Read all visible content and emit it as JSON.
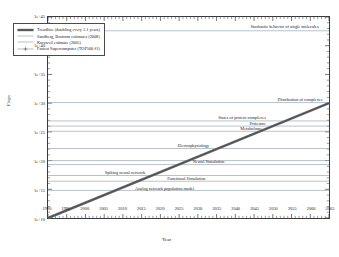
{
  "chart_data": {
    "type": "line",
    "title": "",
    "xlabel": "Year",
    "ylabel": "Flops",
    "xlim": [
      1990,
      2065
    ],
    "ylim": [
      10,
      45
    ],
    "y_scale": "log10",
    "grid": false,
    "xticks": [
      "1990",
      "1995",
      "2000",
      "2005",
      "2010",
      "2015",
      "2020",
      "2025",
      "2030",
      "2035",
      "2040",
      "2045",
      "2050",
      "2055",
      "2060",
      "2065"
    ],
    "xtick_values": [
      1990,
      1995,
      2000,
      2005,
      2010,
      2015,
      2020,
      2025,
      2030,
      2035,
      2040,
      2045,
      2050,
      2055,
      2060,
      2065
    ],
    "yticks": [
      "1e+10",
      "1e+15",
      "1e+20",
      "1e+25",
      "1e+30",
      "1e+35",
      "1e+40",
      "1e+45"
    ],
    "ytick_values": [
      10,
      15,
      20,
      25,
      30,
      35,
      40,
      45
    ],
    "legend_position": "upper-left",
    "series": [
      {
        "name": "Trendline (doubling every 1.1 years)",
        "style": "thick-solid",
        "color": "#6b6b6b",
        "x": [
          1990,
          2065
        ],
        "y_log10": [
          10.0,
          30.0
        ]
      },
      {
        "name": "Sandberg, Bostrom estimates (2008)",
        "style": "thin-solid",
        "color": "#9aa6b4"
      },
      {
        "name": "Kurzweil estimate (2005)",
        "style": "thin-solid",
        "color": "#9aa6b4"
      },
      {
        "name": "Fastest Supercomputer (TOP500 #1)",
        "style": "thin-marker",
        "color": "#8d8d8d"
      }
    ],
    "reference_lines": [
      {
        "label": "Stochastic behavior of single molecules",
        "y_log10": 42.6,
        "align": "right",
        "x_text": 2062
      },
      {
        "label": "Distribution of complexes",
        "y_log10": 30.1,
        "align": "right",
        "x_text": 2063
      },
      {
        "label": "States of protein complexes",
        "y_log10": 26.9,
        "align": "right",
        "x_text": 2048
      },
      {
        "label": "Proteome",
        "y_log10": 26.0,
        "align": "right",
        "x_text": 2048
      },
      {
        "label": "Metabolome",
        "y_log10": 25.1,
        "align": "right",
        "x_text": 2047
      },
      {
        "label": "Electrophysiology",
        "y_log10": 22.1,
        "align": "right",
        "x_text": 2033
      },
      {
        "label": "Neural Simulation",
        "y_log10": 19.3,
        "align": "right",
        "x_text": 2037
      },
      {
        "label": "Spiking neural network",
        "y_log10": 17.4,
        "align": "right",
        "x_text": 2016
      },
      {
        "label": "Functional Simulation",
        "y_log10": 16.4,
        "align": "right",
        "x_text": 2032
      },
      {
        "label": "Analog network population model",
        "y_log10": 14.8,
        "align": "right",
        "x_text": 2029
      },
      {
        "label": "",
        "y_log10": 20.0,
        "align": "right",
        "x_text": 2029
      }
    ]
  },
  "figure": {
    "y_axis_title": "Flops",
    "x_axis_title": "Year"
  }
}
